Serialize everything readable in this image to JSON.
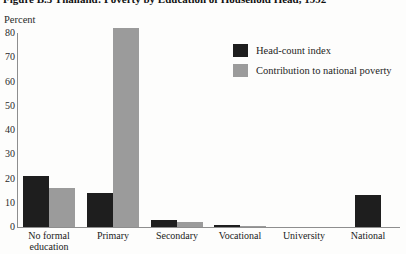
{
  "figure": {
    "title": "Figure B.5 Thailand: Poverty by Education of Household Head, 1992"
  },
  "chart_data": {
    "type": "bar",
    "title": "Figure B.5 Thailand: Poverty by Education of Household Head, 1992",
    "ylabel": "Percent",
    "xlabel": "",
    "categories": [
      "No formal education",
      "Primary",
      "Secondary",
      "Vocational",
      "University",
      "National"
    ],
    "series": [
      {
        "name": "Head-count index",
        "color": "#1e1e1e",
        "values": [
          21,
          14,
          3,
          1,
          0,
          13
        ]
      },
      {
        "name": "Contribution to national poverty",
        "color": "#9b9b9b",
        "values": [
          16,
          82,
          2,
          0.5,
          0,
          null
        ]
      }
    ],
    "y_ticks": [
      0,
      10,
      20,
      30,
      40,
      50,
      60,
      70,
      80
    ],
    "ylim": [
      0,
      80
    ],
    "grid": false,
    "legend_position": "upper-right",
    "axis_color": "#8e8e8e"
  }
}
